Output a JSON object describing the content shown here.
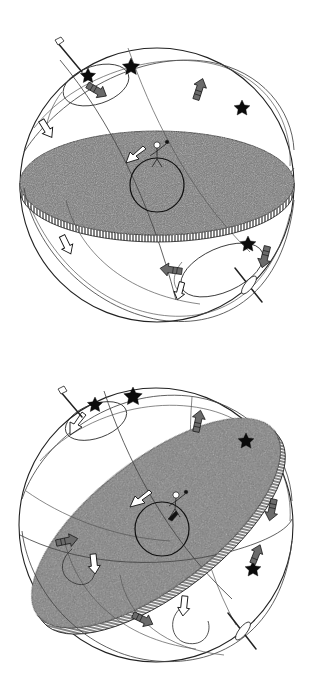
{
  "document": {
    "title": "Celestial Sphere Diagrams",
    "kind": "line-drawing-illustration",
    "panel_count": 2,
    "background_color": "#ffffff",
    "ink_color": "#222222"
  },
  "shared_motifs": {
    "sphere_outline_label": "celestial-sphere",
    "disk_label": "shaded-disk-plane",
    "disk_fill_color": "#787878",
    "disk_rim_label": "hatched-rim",
    "star_label": "five-pointed-star",
    "star_color": "#0b0b0b",
    "dark_arrow_color": "#6b6b6b",
    "white_arrow_color": "#ffffff",
    "observer_label": "standing-human-figure",
    "observer_circle_label": "observer-horizon-circle",
    "axis_pin_label": "axis-pin-needle",
    "orbit_label": "orbit-great-circle"
  },
  "panels": [
    {
      "id": "panel-1",
      "caption": "",
      "disk": {
        "orientation": "horizontal",
        "tilt_degrees": 0,
        "center": [
          157,
          183
        ],
        "radius_x": 137,
        "radius_y": 52,
        "fill": "#787878"
      },
      "sphere": {
        "center": [
          157,
          185
        ],
        "radius": 137
      },
      "stars": 4,
      "dark_arrows": 5,
      "white_arrows": 2,
      "axis_pins": 2,
      "orbit_loops": 2
    },
    {
      "id": "panel-2",
      "caption": "",
      "disk": {
        "orientation": "tilted",
        "tilt_degrees": -38,
        "center": [
          156,
          523
        ],
        "radius_x": 150,
        "radius_y": 63,
        "fill": "#787878"
      },
      "sphere": {
        "center": [
          156,
          525
        ],
        "radius": 137
      },
      "stars": 4,
      "dark_arrows": 6,
      "white_arrows": 3,
      "axis_pins": 2,
      "orbit_loops": 2
    }
  ]
}
